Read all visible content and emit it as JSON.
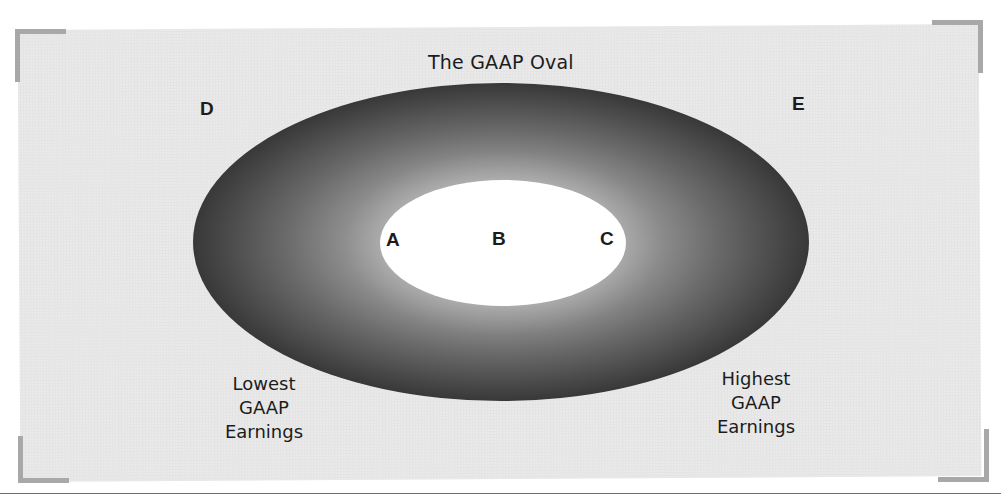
{
  "diagram": {
    "title": "The GAAP Oval",
    "outer_oval": {
      "label": "The GAAP Oval",
      "cx": 501,
      "cy": 242,
      "rx": 308,
      "ry": 159,
      "edge_color": "#383838",
      "inner_color": "#a6a6a6"
    },
    "inner_oval": {
      "cx": 503,
      "cy": 243,
      "rx": 123,
      "ry": 63,
      "color": "#ffffff"
    },
    "points": {
      "a": "A",
      "b": "B",
      "c": "C",
      "d": "D",
      "e": "E"
    },
    "captions": {
      "lowest": [
        "Lowest",
        "GAAP",
        "Earnings"
      ],
      "highest": [
        "Highest",
        "GAAP",
        "Earnings"
      ]
    },
    "colors": {
      "page_background": "#ffffff",
      "panel_background": "#e4e4e4",
      "corner_brackets": "#a8a8a8",
      "text": "#1c1c1c",
      "rule": "#6e6e6e"
    }
  }
}
